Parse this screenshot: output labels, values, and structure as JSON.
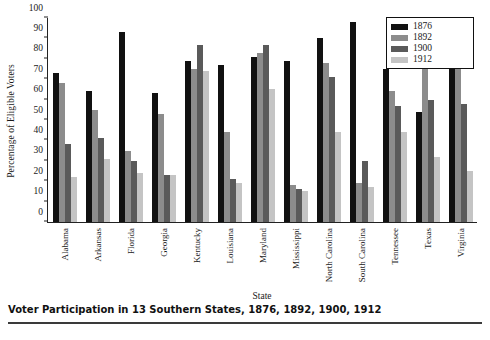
{
  "caption": "Voter Participation in 13 Southern States, 1876, 1892, 1900, 1912",
  "legend": {
    "entries": [
      {
        "label": "1876",
        "color": "#111111"
      },
      {
        "label": "1892",
        "color": "#8c8c8c"
      },
      {
        "label": "1900",
        "color": "#5a5a5a"
      },
      {
        "label": "1912",
        "color": "#c4c4c4"
      }
    ]
  },
  "axes": {
    "ylabel": "Percentage of Eligible Voters",
    "xlabel": "State",
    "yticks": [
      "0",
      "10",
      "20",
      "30",
      "40",
      "50",
      "60",
      "70",
      "80",
      "90",
      "100"
    ]
  },
  "chart_data": {
    "type": "bar",
    "title": "Voter Participation in 13 Southern States, 1876, 1892, 1900, 1912",
    "xlabel": "State",
    "ylabel": "Percentage of Eligible Voters",
    "ylim": [
      0,
      100
    ],
    "grid": false,
    "legend_position": "top-right",
    "categories": [
      "Alabama",
      "Arkansas",
      "Florida",
      "Georgia",
      "Kentucky",
      "Louisiana",
      "Maryland",
      "Mississippi",
      "North Carolina",
      "South Carolina",
      "Tennessee",
      "Texas",
      "Virginia"
    ],
    "series": [
      {
        "name": "1876",
        "color": "#111111",
        "values": [
          73,
          64,
          93,
          63,
          79,
          77,
          81,
          79,
          90,
          98,
          75,
          54,
          78
        ]
      },
      {
        "name": "1892",
        "color": "#8c8c8c",
        "values": [
          68,
          55,
          35,
          53,
          75,
          44,
          83,
          18,
          78,
          19,
          64,
          79,
          75
        ]
      },
      {
        "name": "1900",
        "color": "#5a5a5a",
        "values": [
          38,
          41,
          30,
          23,
          87,
          21,
          87,
          16,
          71,
          30,
          57,
          60,
          58
        ]
      },
      {
        "name": "1912",
        "color": "#c4c4c4",
        "values": [
          22,
          31,
          24,
          23,
          74,
          19,
          65,
          15,
          44,
          17,
          44,
          32,
          25
        ]
      }
    ]
  }
}
